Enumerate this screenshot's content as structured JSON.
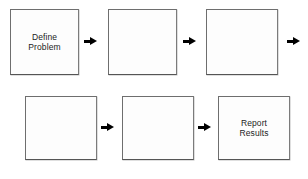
{
  "diagram": {
    "background_color": "#ffffff",
    "box_border_color": "#6e6e6e",
    "box_fill_color": "#fdfdfd",
    "text_color": "#1c1c1c",
    "arrow_color": "#000000",
    "row_count": 2,
    "boxes_per_row": 3,
    "boxes": [
      {
        "id": "box-1",
        "row": 1,
        "position": 1,
        "label": "Define\nProblem",
        "empty": false,
        "x": 10,
        "y": 9,
        "width": 69,
        "height": 66
      },
      {
        "id": "box-2",
        "row": 1,
        "position": 2,
        "label": "",
        "empty": true,
        "x": 108,
        "y": 9,
        "width": 69,
        "height": 66
      },
      {
        "id": "box-3",
        "row": 1,
        "position": 3,
        "label": "",
        "empty": true,
        "x": 206,
        "y": 9,
        "width": 72,
        "height": 66
      },
      {
        "id": "box-4",
        "row": 2,
        "position": 1,
        "label": "",
        "empty": true,
        "x": 25,
        "y": 96,
        "width": 72,
        "height": 64
      },
      {
        "id": "box-5",
        "row": 2,
        "position": 2,
        "label": "",
        "empty": true,
        "x": 122,
        "y": 96,
        "width": 72,
        "height": 64
      },
      {
        "id": "box-6",
        "row": 2,
        "position": 3,
        "label": "Report\nResults",
        "empty": false,
        "x": 218,
        "y": 96,
        "width": 72,
        "height": 64
      }
    ],
    "arrows": [
      {
        "id": "arrow-1",
        "from": "box-1",
        "to": "box-2",
        "x": 88,
        "y": 38
      },
      {
        "id": "arrow-2",
        "from": "box-2",
        "to": "box-3",
        "x": 187,
        "y": 38
      },
      {
        "id": "arrow-3",
        "from": "box-3",
        "to": "box-4",
        "x": 291,
        "y": 38
      },
      {
        "id": "arrow-4",
        "from": "box-4",
        "to": "box-5",
        "x": 105,
        "y": 124
      },
      {
        "id": "arrow-5",
        "from": "box-5",
        "to": "box-6",
        "x": 202,
        "y": 124
      }
    ]
  }
}
